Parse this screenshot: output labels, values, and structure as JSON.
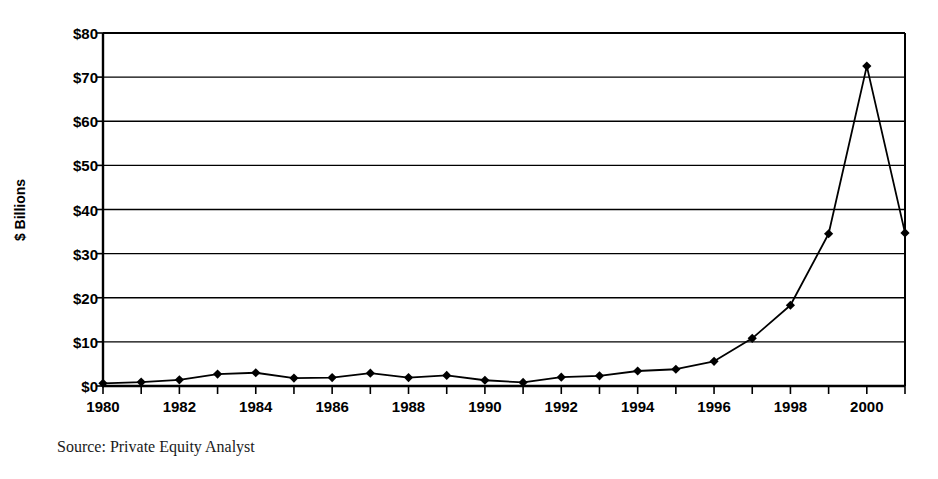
{
  "chart_data": {
    "type": "line",
    "title": "",
    "xlabel": "",
    "ylabel": "$ Billions",
    "x": [
      1980,
      1981,
      1982,
      1983,
      1984,
      1985,
      1986,
      1987,
      1988,
      1989,
      1990,
      1991,
      1992,
      1993,
      1994,
      1995,
      1996,
      1997,
      1998,
      1999,
      2000,
      2001
    ],
    "values": [
      0.6,
      0.9,
      1.4,
      2.7,
      3.0,
      1.8,
      1.9,
      2.9,
      1.9,
      2.4,
      1.3,
      0.8,
      2.0,
      2.3,
      3.4,
      3.8,
      5.6,
      10.8,
      18.3,
      34.5,
      72.5,
      34.7
    ],
    "series": [
      {
        "name": "Venture capital committed",
        "values": [
          0.6,
          0.9,
          1.4,
          2.7,
          3.0,
          1.8,
          1.9,
          2.9,
          1.9,
          2.4,
          1.3,
          0.8,
          2.0,
          2.3,
          3.4,
          3.8,
          5.6,
          10.8,
          18.3,
          34.5,
          72.5,
          34.7
        ]
      }
    ],
    "ylim": [
      0,
      80
    ],
    "xlim": [
      1980,
      2001
    ],
    "ytick_values": [
      0,
      10,
      20,
      30,
      40,
      50,
      60,
      70,
      80
    ],
    "ytick_labels": [
      "$0",
      "$10",
      "$20",
      "$30",
      "$40",
      "$50",
      "$60",
      "$70",
      "$80"
    ],
    "xtick_values": [
      1980,
      1982,
      1984,
      1986,
      1988,
      1990,
      1992,
      1994,
      1996,
      1998,
      2000
    ],
    "xtick_labels": [
      "1980",
      "1982",
      "1984",
      "1986",
      "1988",
      "1990",
      "1992",
      "1994",
      "1996",
      "1998",
      "2000"
    ],
    "grid": "horizontal",
    "legend": "none",
    "marker": "diamond",
    "line_color": "#000000",
    "marker_color": "#000000",
    "background_color": "#ffffff"
  },
  "source_note": "Source: Private Equity Analyst"
}
